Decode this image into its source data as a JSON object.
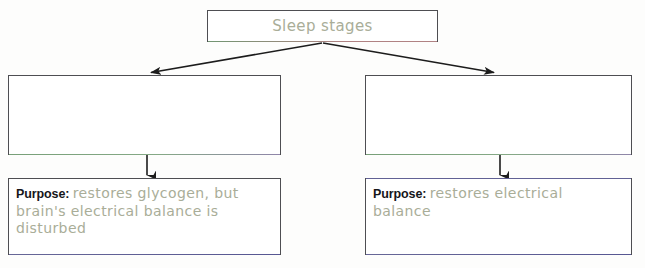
{
  "diagram": {
    "title_box": {
      "label": "Sleep stages"
    },
    "branches": [
      {
        "stage_box": {
          "label": ""
        },
        "purpose_box": {
          "label": "Purpose:",
          "answer": "restores glycogen, but brain's electrical balance is disturbed"
        }
      },
      {
        "stage_box": {
          "label": ""
        },
        "purpose_box": {
          "label": "Purpose:",
          "answer": "restores electrical balance"
        }
      }
    ],
    "colors": {
      "border": "#4e4e52",
      "handwriting": "#a9ad98",
      "printed_label": "#16161a",
      "arrow": "#1c1c1c",
      "page_background": "#fdfdfc"
    }
  }
}
